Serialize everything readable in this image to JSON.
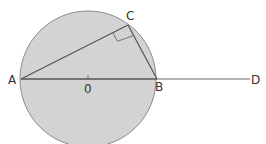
{
  "diagram": {
    "type": "circle-geometry",
    "colors": {
      "circle_fill": "#d3d3d3",
      "circle_stroke": "#8c8c8c",
      "line": "#555555",
      "extension_line": "#9a9a9a"
    },
    "circle": {
      "cx": 88,
      "cy": 79,
      "r": 68
    },
    "points": {
      "A": {
        "label": "A",
        "x": 21,
        "y": 79
      },
      "B": {
        "label": "B",
        "x": 157,
        "y": 79
      },
      "C": {
        "label": "C",
        "x": 128,
        "y": 25
      },
      "D": {
        "label": "D",
        "x": 250,
        "y": 79
      },
      "O": {
        "label": "0",
        "x": 88,
        "y": 79
      }
    },
    "segments": [
      "AB",
      "AC",
      "CB",
      "BD"
    ],
    "right_angle_at": "C"
  }
}
